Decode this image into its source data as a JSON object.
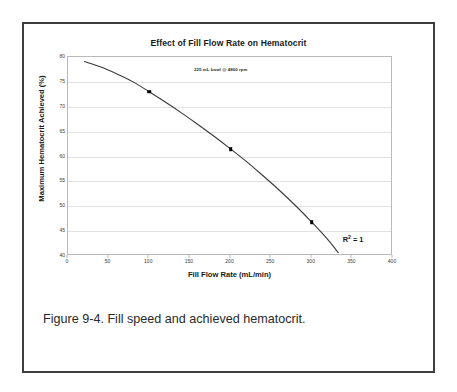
{
  "figure": {
    "caption": "Figure 9-4. Fill speed and achieved hematocrit.",
    "border_color": "#3d3d3d"
  },
  "chart_data": {
    "type": "line",
    "title": "Effect of Fill Flow Rate on Hematocrit",
    "xlabel": "Fill Flow Rate (mL/min)",
    "ylabel": "Maximum Hematocrit Achieved (%)",
    "xlim": [
      0,
      400
    ],
    "ylim": [
      40,
      80
    ],
    "xticks": [
      0,
      50,
      100,
      150,
      200,
      250,
      300,
      350,
      400
    ],
    "xtick_labels": [
      "0",
      "50",
      "100",
      "150",
      "200",
      "250",
      "300",
      "350",
      "400"
    ],
    "yticks": [
      40,
      45,
      50,
      55,
      60,
      65,
      70,
      75,
      80
    ],
    "ytick_labels": [
      "40",
      "45",
      "50",
      "55",
      "60",
      "65",
      "70",
      "75",
      "80"
    ],
    "grid": "horizontal",
    "legend": "none",
    "annotation": "225 mL bowl @ 4800 rpm",
    "fit_label": "R",
    "fit_exponent": "2",
    "fit_value": " = 1",
    "line_color": "#3a3a3a",
    "marker_color": "#000000",
    "markers": [
      {
        "x": 100,
        "y": 73.0
      },
      {
        "x": 200,
        "y": 61.5
      },
      {
        "x": 300,
        "y": 46.8
      }
    ],
    "curve": [
      {
        "x": 20,
        "y": 79.1
      },
      {
        "x": 40,
        "y": 78.0
      },
      {
        "x": 60,
        "y": 76.6
      },
      {
        "x": 80,
        "y": 75.0
      },
      {
        "x": 100,
        "y": 73.0
      },
      {
        "x": 120,
        "y": 70.9
      },
      {
        "x": 140,
        "y": 68.7
      },
      {
        "x": 160,
        "y": 66.4
      },
      {
        "x": 180,
        "y": 64.0
      },
      {
        "x": 200,
        "y": 61.5
      },
      {
        "x": 220,
        "y": 58.9
      },
      {
        "x": 240,
        "y": 56.1
      },
      {
        "x": 260,
        "y": 53.2
      },
      {
        "x": 280,
        "y": 50.1
      },
      {
        "x": 300,
        "y": 46.8
      },
      {
        "x": 315,
        "y": 44.2
      },
      {
        "x": 325,
        "y": 42.3
      },
      {
        "x": 335,
        "y": 40.2
      }
    ]
  }
}
